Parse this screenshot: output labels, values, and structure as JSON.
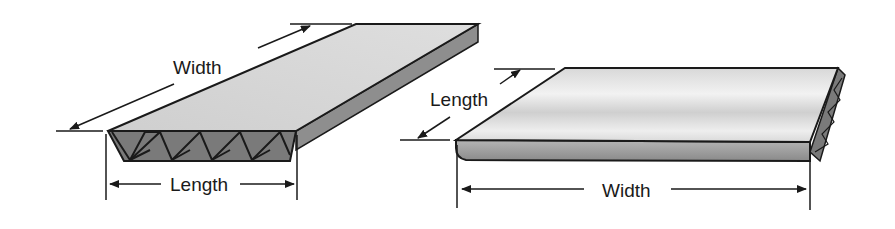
{
  "diagram": {
    "left_panel": {
      "description": "board with flutes visible on front edge",
      "width_label": "Width",
      "length_label": "Length"
    },
    "right_panel": {
      "description": "board with flutes visible on side edge",
      "length_label": "Length",
      "width_label": "Width"
    },
    "colors": {
      "top_face": "#d4d4d4",
      "side_face": "#8e8e8e",
      "flute_face": "#7a7a7a",
      "outline": "#1a1a1a",
      "background": "#ffffff"
    }
  }
}
